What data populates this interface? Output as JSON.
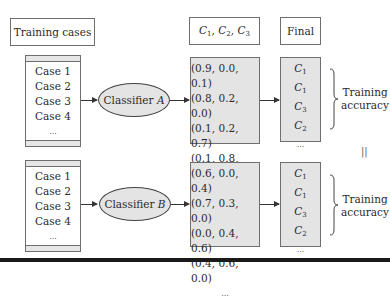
{
  "headers": {
    "training_cases": "Training cases",
    "classes": {
      "c": "C",
      "subs": [
        "1",
        "2",
        "3"
      ]
    },
    "final": "Final"
  },
  "rows": [
    {
      "cases": [
        "Case 1",
        "Case 2",
        "Case 3",
        "Case 4",
        "..."
      ],
      "classifier": {
        "prefix": "Classifier ",
        "name": "A"
      },
      "probabilities": [
        "(0.9, 0.0, 0.1)",
        "(0.8, 0.2, 0.0)",
        "(0.1, 0.2, 0.7)",
        "(0.1, 0.8, 0.1)",
        "..."
      ],
      "final": [
        {
          "c": "C",
          "sub": "1"
        },
        {
          "c": "C",
          "sub": "1"
        },
        {
          "c": "C",
          "sub": "3"
        },
        {
          "c": "C",
          "sub": "2"
        }
      ],
      "final_more": "...",
      "accuracy_label": [
        "Training",
        "accuracy"
      ]
    },
    {
      "cases": [
        "Case 1",
        "Case 2",
        "Case 3",
        "Case 4",
        "..."
      ],
      "classifier": {
        "prefix": "Classifier ",
        "name": "B"
      },
      "probabilities": [
        "(0.6, 0.0, 0.4)",
        "(0.7, 0.3, 0.0)",
        "(0.0, 0.4, 0.6)",
        "(0.4, 0.6, 0.0)",
        "..."
      ],
      "final": [
        {
          "c": "C",
          "sub": "1"
        },
        {
          "c": "C",
          "sub": "1"
        },
        {
          "c": "C",
          "sub": "3"
        },
        {
          "c": "C",
          "sub": "2"
        }
      ],
      "final_more": "...",
      "accuracy_label": [
        "Training",
        "accuracy"
      ]
    }
  ],
  "equality_symbol": "||",
  "colors": {
    "box_fill": "#e4e4e4",
    "border": "#6e6e6e",
    "rule": "#1a1a1a"
  }
}
